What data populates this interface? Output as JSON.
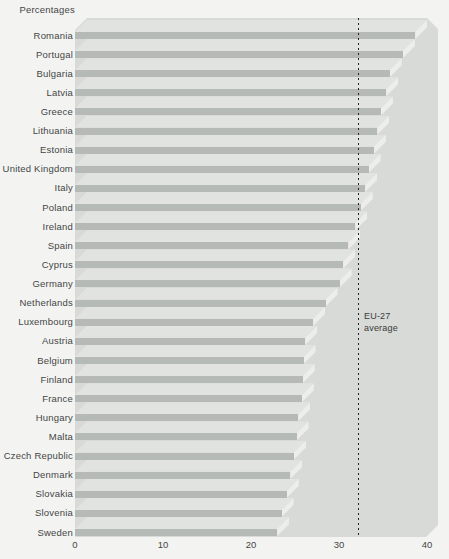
{
  "unit_label": "Percentages",
  "chart_data": {
    "type": "bar",
    "orientation": "horizontal",
    "title": "Percentages",
    "xlabel": "",
    "ylabel": "",
    "unit": "percent",
    "xlim": [
      0,
      40
    ],
    "xticks": [
      0,
      10,
      20,
      30,
      40
    ],
    "grid": false,
    "style": "3d-horizontal-bars",
    "categories": [
      "Romania",
      "Portugal",
      "Bulgaria",
      "Latvia",
      "Greece",
      "Lithuania",
      "Estonia",
      "United Kingdom",
      "Italy",
      "Poland",
      "Ireland",
      "Spain",
      "Cyprus",
      "Germany",
      "Netherlands",
      "Luxembourg",
      "Austria",
      "Belgium",
      "Finland",
      "France",
      "Hungary",
      "Malta",
      "Czech Republic",
      "Denmark",
      "Slovakia",
      "Slovenia",
      "Sweden"
    ],
    "values": [
      38.7,
      37.3,
      35.8,
      35.4,
      34.8,
      34.4,
      34.0,
      33.4,
      33.0,
      32.5,
      31.9,
      31.1,
      30.5,
      30.1,
      28.5,
      27.1,
      26.2,
      26.0,
      25.9,
      25.8,
      25.4,
      25.2,
      24.9,
      24.5,
      24.1,
      23.5,
      23.0
    ],
    "reference_line": {
      "value": 32.2,
      "label_line1": "EU-27",
      "label_line2": "average"
    },
    "colors": {
      "page_bg": "#f3f4f2",
      "panel_bg": "#d8dad7",
      "bar_face": "#b6bab7",
      "bar_top": "#e1e3e0",
      "bar_end": "#edeeec",
      "refline": "#222222",
      "text": "#454545"
    }
  }
}
